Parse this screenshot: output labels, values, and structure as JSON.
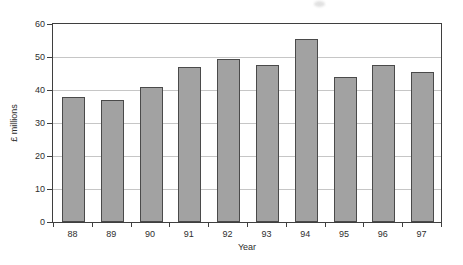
{
  "chart_data": {
    "type": "bar",
    "title": "",
    "categories": [
      "88",
      "89",
      "90",
      "91",
      "92",
      "93",
      "94",
      "95",
      "96",
      "97"
    ],
    "values": [
      38,
      37,
      41,
      47,
      49.5,
      47.5,
      55.5,
      44,
      47.5,
      45.5
    ],
    "xlabel": "Year",
    "ylabel": "£ millions",
    "ylim": [
      0,
      60
    ],
    "yticks": [
      0,
      10,
      20,
      30,
      40,
      50,
      60
    ],
    "grid": true,
    "legend": "none",
    "colors": {
      "bar_fill": "#a2a2a2",
      "bar_border": "#4a4a4a",
      "gridline": "#c6c6c6",
      "axis_frame": "#3f3f3f",
      "text": "#2e2e2e",
      "background": "#ffffff",
      "scan_artifact": "#dadada"
    }
  }
}
